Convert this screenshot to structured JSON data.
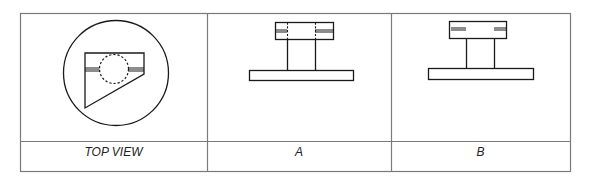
{
  "table": {
    "columns": [
      {
        "id": "top-view",
        "label": "TOP VIEW"
      },
      {
        "id": "a",
        "label": "A"
      },
      {
        "id": "b",
        "label": "B"
      }
    ]
  },
  "colors": {
    "stroke": "#1a1a1a",
    "grid": "#7a7a7a",
    "shade": "#8c8c8c",
    "background": "#ffffff"
  }
}
